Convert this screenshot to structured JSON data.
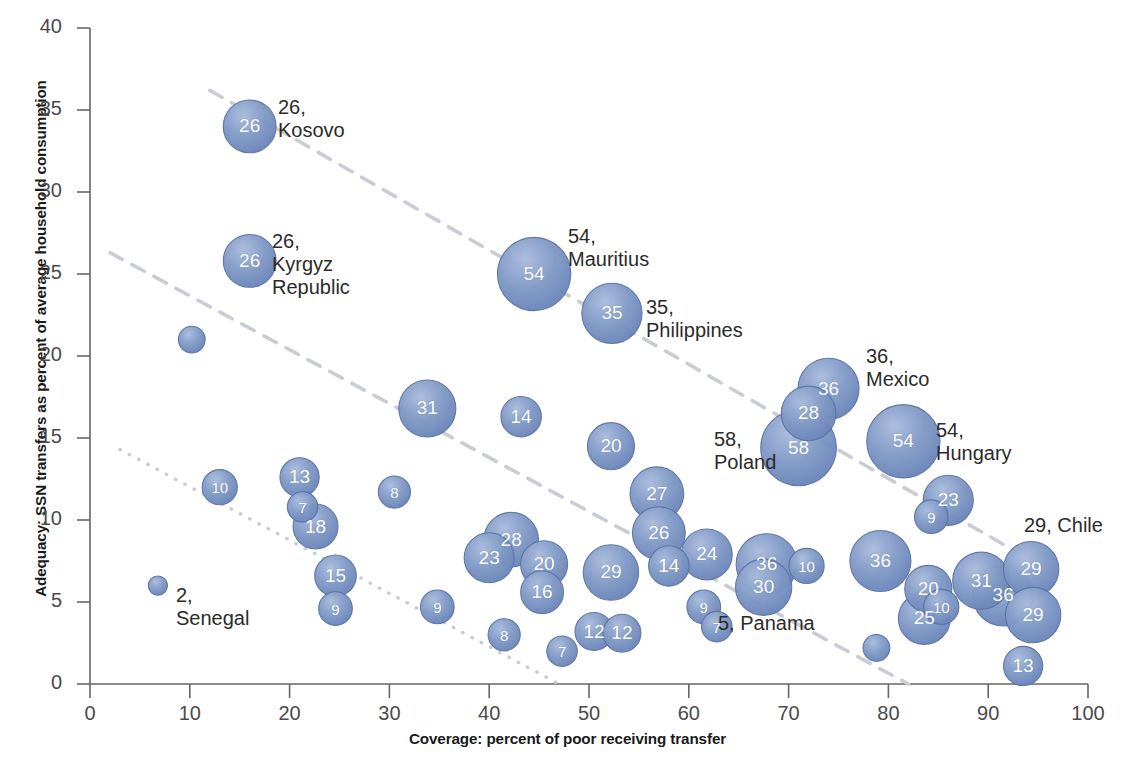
{
  "chart_data": {
    "type": "scatter",
    "title": "",
    "xlabel": "Coverage: percent of poor receiving transfer",
    "ylabel": "Adequacy: SSN transfers as percent of average household consumption",
    "xlim": [
      0,
      100
    ],
    "ylim": [
      0,
      40
    ],
    "xticks": [
      0,
      10,
      20,
      30,
      40,
      50,
      60,
      70,
      80,
      90,
      100
    ],
    "yticks": [
      0,
      5,
      10,
      15,
      20,
      25,
      30,
      35,
      40
    ],
    "grid": false,
    "legend": "none",
    "bubble_note": "Bubble size encodes the labelled value (percent); number printed inside or beside each bubble",
    "points": [
      {
        "label": "26",
        "country": "Kosovo",
        "x": 16.0,
        "y": 34.0,
        "size": 26,
        "callout": "26,\nKosovo",
        "callout_x": 278,
        "callout_y": 96
      },
      {
        "label": "26",
        "country": "Kyrgyz Republic",
        "x": 16.0,
        "y": 25.8,
        "size": 26,
        "callout": "26,\nKyrgyz\nRepublic",
        "callout_x": 272,
        "callout_y": 230
      },
      {
        "label": "5",
        "country": "",
        "x": 10.2,
        "y": 21.0,
        "size": 5
      },
      {
        "label": "54",
        "country": "Mauritius",
        "x": 44.5,
        "y": 25.0,
        "size": 54,
        "callout": "54,\nMauritius",
        "callout_x": 568,
        "callout_y": 225
      },
      {
        "label": "35",
        "country": "Philippines",
        "x": 52.3,
        "y": 22.6,
        "size": 35,
        "callout": "35,\nPhilippines",
        "callout_x": 646,
        "callout_y": 296
      },
      {
        "label": "36",
        "country": "Mexico",
        "x": 74.0,
        "y": 18.0,
        "size": 36,
        "callout": "36,\nMexico",
        "callout_x": 866,
        "callout_y": 345
      },
      {
        "label": "28",
        "country": "",
        "x": 72.0,
        "y": 16.5,
        "size": 28
      },
      {
        "label": "58",
        "country": "Poland",
        "x": 71.0,
        "y": 14.4,
        "size": 58,
        "callout": "58,\nPoland",
        "callout_x": 714,
        "callout_y": 428
      },
      {
        "label": "54",
        "country": "Hungary",
        "x": 81.5,
        "y": 14.8,
        "size": 54,
        "callout": "54,\nHungary",
        "callout_x": 936,
        "callout_y": 419
      },
      {
        "label": "23",
        "country": "",
        "x": 86.0,
        "y": 11.2,
        "size": 23
      },
      {
        "label": "9",
        "country": "",
        "x": 84.3,
        "y": 10.2,
        "size": 9
      },
      {
        "label": "31",
        "country": "",
        "x": 33.8,
        "y": 16.8,
        "size": 31
      },
      {
        "label": "14",
        "country": "",
        "x": 43.2,
        "y": 16.3,
        "size": 14
      },
      {
        "label": "20",
        "country": "",
        "x": 52.2,
        "y": 14.5,
        "size": 20
      },
      {
        "label": "27",
        "country": "",
        "x": 56.8,
        "y": 11.6,
        "size": 27
      },
      {
        "label": "26",
        "country": "",
        "x": 57.0,
        "y": 9.2,
        "size": 26
      },
      {
        "label": "24",
        "country": "",
        "x": 61.8,
        "y": 7.9,
        "size": 24
      },
      {
        "label": "14",
        "country": "",
        "x": 58.0,
        "y": 7.2,
        "size": 14
      },
      {
        "label": "29",
        "country": "",
        "x": 52.2,
        "y": 6.8,
        "size": 29
      },
      {
        "label": "13",
        "country": "",
        "x": 21.0,
        "y": 12.6,
        "size": 13
      },
      {
        "label": "7",
        "country": "",
        "x": 21.3,
        "y": 10.8,
        "size": 7
      },
      {
        "label": "18",
        "country": "",
        "x": 22.6,
        "y": 9.6,
        "size": 18
      },
      {
        "label": "10",
        "country": "",
        "x": 13.0,
        "y": 12.0,
        "size": 10
      },
      {
        "label": "8",
        "country": "",
        "x": 30.5,
        "y": 11.7,
        "size": 8
      },
      {
        "label": "28",
        "country": "",
        "x": 42.2,
        "y": 8.8,
        "size": 28
      },
      {
        "label": "23",
        "country": "",
        "x": 40.0,
        "y": 7.7,
        "size": 23
      },
      {
        "label": "20",
        "country": "",
        "x": 45.5,
        "y": 7.3,
        "size": 20
      },
      {
        "label": "16",
        "country": "",
        "x": 45.3,
        "y": 5.6,
        "size": 16
      },
      {
        "label": "15",
        "country": "",
        "x": 24.6,
        "y": 6.6,
        "size": 15
      },
      {
        "label": "9",
        "country": "",
        "x": 24.6,
        "y": 4.6,
        "size": 9
      },
      {
        "label": "9",
        "country": "",
        "x": 34.8,
        "y": 4.7,
        "size": 9
      },
      {
        "label": "8",
        "country": "",
        "x": 41.5,
        "y": 3.0,
        "size": 8
      },
      {
        "label": "7",
        "country": "",
        "x": 47.3,
        "y": 2.0,
        "size": 7
      },
      {
        "label": "12",
        "country": "",
        "x": 50.5,
        "y": 3.2,
        "size": 12
      },
      {
        "label": "12",
        "country": "",
        "x": 53.3,
        "y": 3.1,
        "size": 12
      },
      {
        "label": "9",
        "country": "",
        "x": 61.5,
        "y": 4.7,
        "size": 9
      },
      {
        "label": "7",
        "country": "",
        "x": 62.8,
        "y": 3.5,
        "size": 7
      },
      {
        "label": "2",
        "country": "Senegal",
        "x": 6.8,
        "y": 6.0,
        "size": 2,
        "callout": "2,\nSenegal",
        "callout_x": 176,
        "callout_y": 584
      },
      {
        "label": "36",
        "country": "",
        "x": 67.8,
        "y": 7.3,
        "size": 36
      },
      {
        "label": "30",
        "country": "",
        "x": 67.5,
        "y": 5.9,
        "size": 30
      },
      {
        "label": "10",
        "country": "",
        "x": 71.8,
        "y": 7.2,
        "size": 10
      },
      {
        "label": "36",
        "country": "",
        "x": 79.2,
        "y": 7.5,
        "size": 36
      },
      {
        "label": "20",
        "country": "",
        "x": 84.0,
        "y": 5.8,
        "size": 20
      },
      {
        "label": "25",
        "country": "",
        "x": 83.6,
        "y": 4.0,
        "size": 25
      },
      {
        "label": "10",
        "country": "",
        "x": 85.3,
        "y": 4.7,
        "size": 10
      },
      {
        "label": "5",
        "country": "Panama",
        "x": 78.8,
        "y": 2.2,
        "size": 5,
        "callout": "5, Panama",
        "callout_x": 718,
        "callout_y": 612
      },
      {
        "label": "31",
        "country": "",
        "x": 89.3,
        "y": 6.3,
        "size": 31
      },
      {
        "label": "36",
        "country": "",
        "x": 91.5,
        "y": 5.4,
        "size": 36
      },
      {
        "label": "29",
        "country": "Chile",
        "x": 94.3,
        "y": 7.0,
        "size": 29,
        "callout": "29, Chile",
        "callout_x": 1024,
        "callout_y": 514
      },
      {
        "label": "29",
        "country": "",
        "x": 94.5,
        "y": 4.2,
        "size": 29
      },
      {
        "label": "13",
        "country": "",
        "x": 93.5,
        "y": 1.1,
        "size": 13
      }
    ],
    "trendlines": [
      {
        "name": "upper-dashed",
        "style": "dashed",
        "x0": 12.0,
        "y0": 36.2,
        "x1": 93.0,
        "y1": 8.0
      },
      {
        "name": "middle-dashed",
        "style": "dashed",
        "x0": 2.0,
        "y0": 26.3,
        "x1": 82.0,
        "y1": 0.0
      },
      {
        "name": "lower-dotted",
        "style": "dotted",
        "x0": 3.0,
        "y0": 14.3,
        "x1": 47.0,
        "y1": 0.0
      }
    ]
  },
  "colors": {
    "bubble_fill": "#7d95c3",
    "bubble_edge": "#5c74a6",
    "bubble_highlight": "#a8bbdc",
    "axis": "#666666",
    "tick_text": "#4a4a4a",
    "label_text": "#2b2b2b",
    "trendline": "#c9cdd3"
  }
}
